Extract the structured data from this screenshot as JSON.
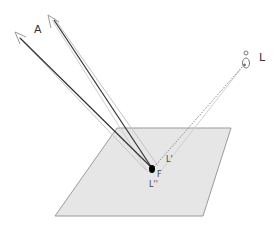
{
  "diagram": {
    "labels": {
      "eye_label": "A",
      "light_label": "L",
      "reflected_label": "L'",
      "point_label": "F",
      "secondary_label": "L''"
    },
    "elements": {
      "plane": "gray parallelogram surface",
      "point": "F (black dot on plane)",
      "rays_to_eye": 2,
      "light_ray": "dotted line from F to light bulb L"
    },
    "colors": {
      "plane_fill": "#e6e6e6",
      "plane_stroke": "#9a9a9a",
      "dark_ray": "#333333",
      "light_ray": "#b0b0b0",
      "dot": "#000000"
    }
  }
}
